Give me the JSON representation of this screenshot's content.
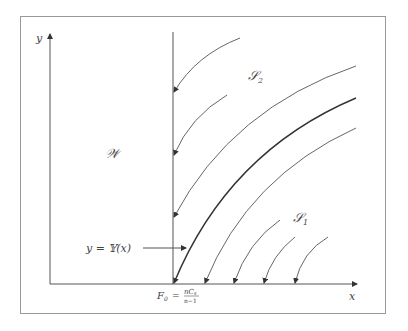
{
  "diagram": {
    "axes": {
      "x_label": "x",
      "y_label": "y"
    },
    "regions": {
      "W": "𝒲",
      "S2": "𝒮",
      "S2_sub": "2",
      "S1": "𝒮",
      "S1_sub": "1"
    },
    "curve_label": "y = 𝕐(x)",
    "origin_label": {
      "F": "F",
      "F_sub": "0",
      "eq": "=",
      "num": "nC",
      "num_sub": "s",
      "den": "n−1"
    },
    "colors": {
      "frame": "#888888",
      "lines": "#555555",
      "separatrix": "#222222"
    }
  }
}
